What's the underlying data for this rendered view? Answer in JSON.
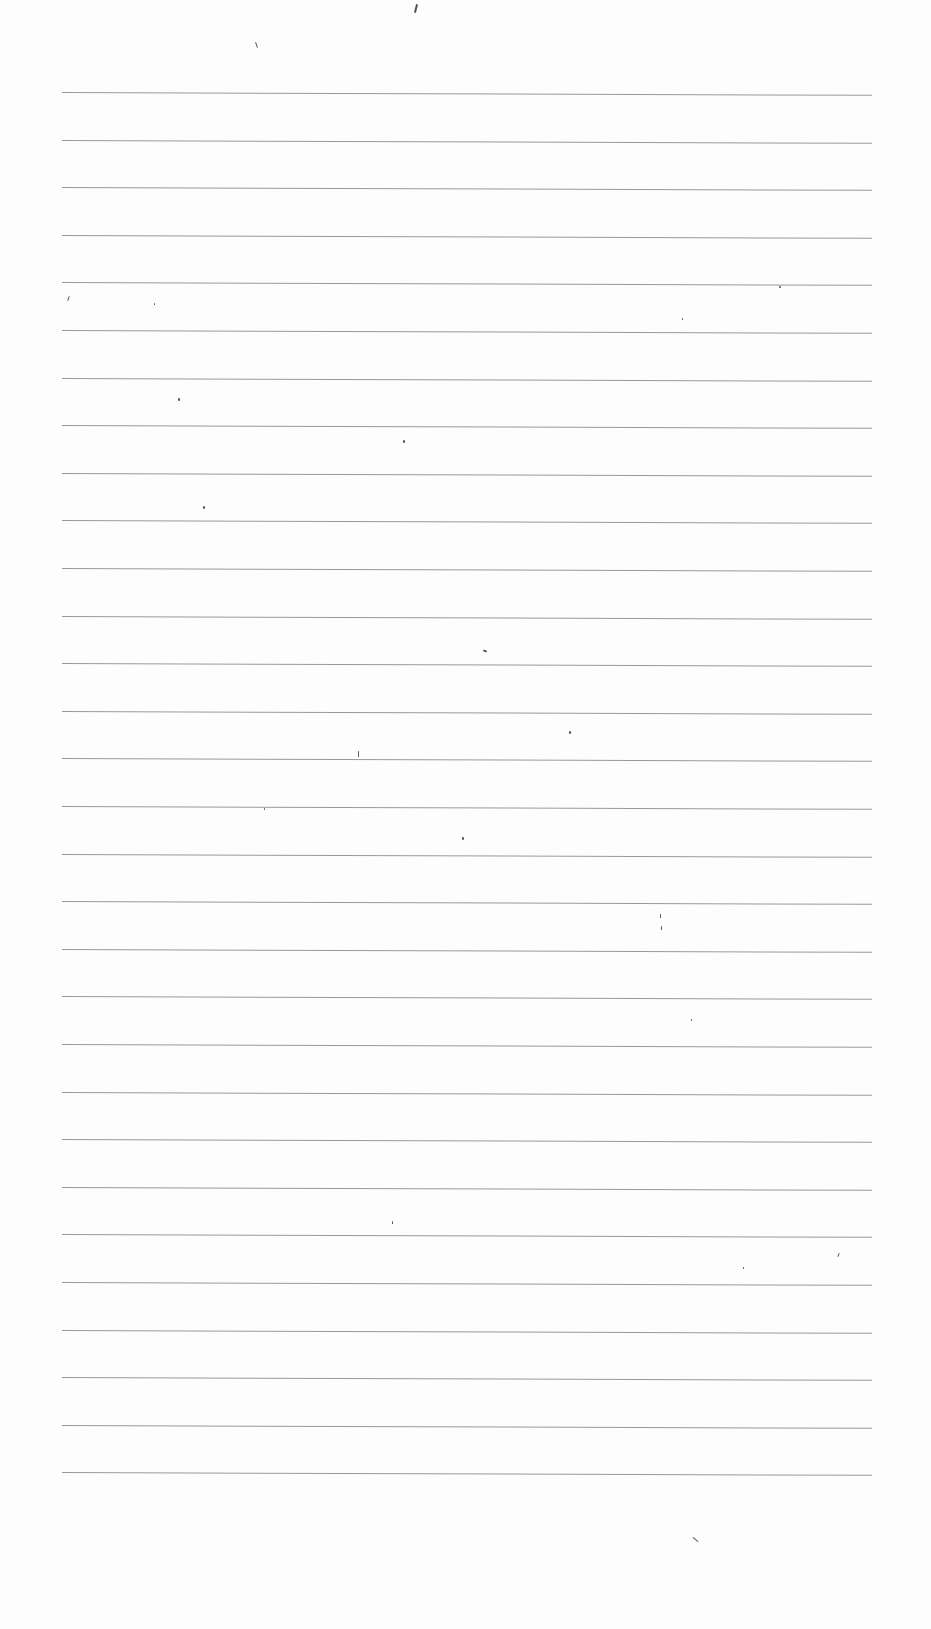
{
  "document": {
    "type": "blank ruled sheet",
    "content_text": "",
    "rule_count": 30,
    "rule_color": "#9a9a9a",
    "paper_color": "#fdfdfd",
    "rules": {
      "x_start": 62,
      "x_end": 872,
      "y_first": 92,
      "spacing": 47.6
    },
    "specks": [
      {
        "x": 415,
        "y": 4,
        "w": 2,
        "h": 9,
        "rot": 15
      },
      {
        "x": 256,
        "y": 42,
        "w": 1,
        "h": 6,
        "rot": -20
      },
      {
        "x": 68,
        "y": 296,
        "w": 1,
        "h": 5,
        "rot": 20
      },
      {
        "x": 154,
        "y": 303,
        "w": 1,
        "h": 2,
        "rot": 0
      },
      {
        "x": 178,
        "y": 398,
        "w": 2,
        "h": 3,
        "rot": 0
      },
      {
        "x": 403,
        "y": 440,
        "w": 2,
        "h": 3,
        "rot": 0
      },
      {
        "x": 203,
        "y": 506,
        "w": 2,
        "h": 3,
        "rot": 0
      },
      {
        "x": 483,
        "y": 650,
        "w": 4,
        "h": 2,
        "rot": 20
      },
      {
        "x": 569,
        "y": 731,
        "w": 2,
        "h": 3,
        "rot": 0
      },
      {
        "x": 358,
        "y": 751,
        "w": 1,
        "h": 6,
        "rot": 0
      },
      {
        "x": 264,
        "y": 808,
        "w": 1,
        "h": 2,
        "rot": 0
      },
      {
        "x": 462,
        "y": 837,
        "w": 2,
        "h": 3,
        "rot": 0
      },
      {
        "x": 660,
        "y": 914,
        "w": 1,
        "h": 4,
        "rot": 0
      },
      {
        "x": 661,
        "y": 926,
        "w": 1,
        "h": 4,
        "rot": 0
      },
      {
        "x": 691,
        "y": 1019,
        "w": 1,
        "h": 2,
        "rot": 0
      },
      {
        "x": 392,
        "y": 1221,
        "w": 1,
        "h": 3,
        "rot": 0
      },
      {
        "x": 743,
        "y": 1267,
        "w": 1,
        "h": 2,
        "rot": 0
      },
      {
        "x": 838,
        "y": 1253,
        "w": 1,
        "h": 4,
        "rot": 20
      },
      {
        "x": 695,
        "y": 1536,
        "w": 1,
        "h": 7,
        "rot": -50
      },
      {
        "x": 779,
        "y": 286,
        "w": 2,
        "h": 2,
        "rot": 0
      },
      {
        "x": 682,
        "y": 318,
        "w": 1,
        "h": 2,
        "rot": 0
      }
    ]
  }
}
